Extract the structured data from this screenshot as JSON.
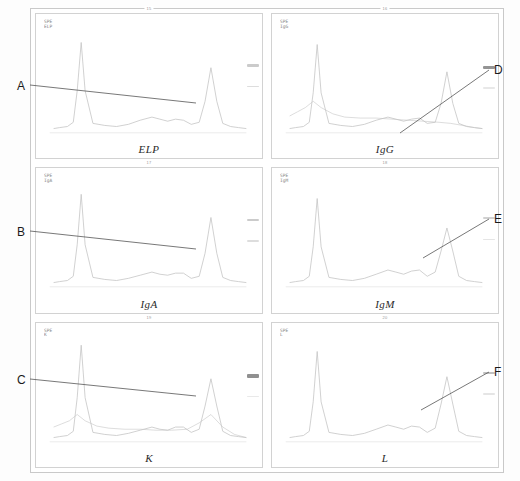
{
  "figure": {
    "type": "immunofixation-electrophoresis-densitometry",
    "panel_rows": 3,
    "panel_cols": 2,
    "frame_color": "#c9c9c9",
    "trace_color": "#c4c4c4",
    "annotation_color": "#555555"
  },
  "panels": [
    {
      "id": "elp",
      "title": "ELP",
      "number": "15",
      "corner_label": "SPE\nELP",
      "bands": [
        {
          "top_pct": 28,
          "height_px": 2.2,
          "color": "#b9b9b9",
          "opacity": 0.75
        },
        {
          "top_pct": 60,
          "height_px": 1.8,
          "color": "#c6c6c6",
          "opacity": 0.6
        }
      ]
    },
    {
      "id": "igg",
      "title": "IgG",
      "number": "16",
      "corner_label": "SPE\nIgG",
      "bands": [
        {
          "top_pct": 30,
          "height_px": 3.2,
          "color": "#8e8e8e",
          "opacity": 0.95
        },
        {
          "top_pct": 62,
          "height_px": 1.6,
          "color": "#d2d2d2",
          "opacity": 0.5
        }
      ]
    },
    {
      "id": "iga",
      "title": "IgA",
      "number": "17",
      "corner_label": "SPE\nIgA",
      "bands": [
        {
          "top_pct": 28,
          "height_px": 2.2,
          "color": "#b9b9b9",
          "opacity": 0.75
        },
        {
          "top_pct": 60,
          "height_px": 1.8,
          "color": "#c6c6c6",
          "opacity": 0.6
        }
      ]
    },
    {
      "id": "igm",
      "title": "IgM",
      "number": "18",
      "corner_label": "SPE\nIgM",
      "bands": [
        {
          "top_pct": 26,
          "height_px": 2.0,
          "color": "#bdbdbd",
          "opacity": 0.7
        },
        {
          "top_pct": 58,
          "height_px": 1.6,
          "color": "#cfcfcf",
          "opacity": 0.55
        }
      ]
    },
    {
      "id": "k",
      "title": "K",
      "number": "19",
      "corner_label": "SPE\nK",
      "bands": [
        {
          "top_pct": 30,
          "height_px": 3.4,
          "color": "#8a8a8a",
          "opacity": 0.95
        },
        {
          "top_pct": 62,
          "height_px": 1.6,
          "color": "#d4d4d4",
          "opacity": 0.5
        }
      ]
    },
    {
      "id": "l",
      "title": "L",
      "number": "20",
      "corner_label": "SPE\nL",
      "bands": [
        {
          "top_pct": 26,
          "height_px": 2.4,
          "color": "#b0b0b0",
          "opacity": 0.8
        },
        {
          "top_pct": 58,
          "height_px": 1.6,
          "color": "#d0d0d0",
          "opacity": 0.55
        }
      ]
    }
  ],
  "annotations": [
    {
      "letter": "A",
      "side": "left",
      "lx": 17,
      "ly": 80,
      "x1": 30,
      "y1": 85,
      "x2": 196,
      "y2": 103
    },
    {
      "letter": "B",
      "side": "left",
      "lx": 17,
      "ly": 226,
      "x1": 30,
      "y1": 231,
      "x2": 196,
      "y2": 249
    },
    {
      "letter": "C",
      "side": "left",
      "lx": 17,
      "ly": 374,
      "x1": 30,
      "y1": 379,
      "x2": 196,
      "y2": 396
    },
    {
      "letter": "D",
      "side": "right",
      "lx": 494,
      "ly": 64,
      "x1": 489,
      "y1": 70,
      "x2": 400,
      "y2": 133
    },
    {
      "letter": "E",
      "side": "right",
      "lx": 494,
      "ly": 213,
      "x1": 489,
      "y1": 219,
      "x2": 423,
      "y2": 258
    },
    {
      "letter": "F",
      "side": "right",
      "lx": 494,
      "ly": 366,
      "x1": 489,
      "y1": 372,
      "x2": 421,
      "y2": 410
    }
  ],
  "chart_data": {
    "type": "line",
    "xlabel": "",
    "ylabel": "",
    "grid": false,
    "legend": "none",
    "xlim": [
      0,
      100
    ],
    "ylim": [
      0,
      100
    ],
    "shared_x_categories": [
      "albumin",
      "alpha-1",
      "alpha-2",
      "beta",
      "gamma"
    ],
    "series": [
      {
        "name": "ELP",
        "panel": "elp",
        "x": [
          2,
          5,
          9,
          12,
          14,
          16,
          18,
          22,
          28,
          34,
          40,
          46,
          52,
          56,
          60,
          64,
          68,
          72,
          76,
          79,
          82,
          85,
          88,
          92,
          96,
          100
        ],
        "values": [
          4,
          5,
          6,
          10,
          40,
          86,
          40,
          9,
          7,
          6,
          8,
          12,
          15,
          13,
          11,
          13,
          12,
          8,
          10,
          30,
          62,
          30,
          9,
          6,
          5,
          4
        ]
      },
      {
        "name": "IgG",
        "panel": "igg",
        "x": [
          2,
          5,
          9,
          12,
          14,
          16,
          18,
          22,
          28,
          34,
          40,
          46,
          52,
          56,
          60,
          64,
          68,
          72,
          76,
          79,
          82,
          85,
          88,
          92,
          96,
          100
        ],
        "values": [
          4,
          5,
          6,
          10,
          38,
          84,
          38,
          9,
          7,
          6,
          8,
          12,
          15,
          13,
          11,
          13,
          14,
          9,
          10,
          28,
          58,
          28,
          9,
          6,
          5,
          4
        ]
      },
      {
        "name": "IgG-overlay",
        "panel": "igg",
        "overlay": true,
        "x": [
          2,
          6,
          10,
          14,
          18,
          24,
          30,
          38,
          46,
          54,
          62,
          70,
          78,
          84,
          90,
          96,
          100
        ],
        "values": [
          16,
          20,
          24,
          30,
          24,
          18,
          15,
          14,
          14,
          13,
          12,
          11,
          10,
          9,
          7,
          5,
          4
        ]
      },
      {
        "name": "IgA",
        "panel": "iga",
        "x": [
          2,
          5,
          9,
          12,
          14,
          16,
          18,
          22,
          28,
          34,
          40,
          46,
          52,
          56,
          60,
          64,
          68,
          72,
          76,
          79,
          82,
          85,
          88,
          92,
          96,
          100
        ],
        "values": [
          4,
          5,
          6,
          10,
          40,
          88,
          40,
          9,
          7,
          6,
          8,
          11,
          14,
          12,
          11,
          13,
          13,
          8,
          10,
          32,
          66,
          32,
          9,
          6,
          5,
          4
        ]
      },
      {
        "name": "IgM",
        "panel": "igm",
        "x": [
          2,
          5,
          9,
          12,
          14,
          16,
          18,
          22,
          28,
          34,
          40,
          46,
          52,
          56,
          60,
          64,
          68,
          72,
          76,
          79,
          82,
          85,
          88,
          92,
          96,
          100
        ],
        "values": [
          4,
          5,
          6,
          10,
          38,
          84,
          38,
          9,
          7,
          6,
          8,
          12,
          16,
          14,
          12,
          15,
          16,
          10,
          14,
          34,
          56,
          34,
          10,
          6,
          5,
          4
        ]
      },
      {
        "name": "K",
        "panel": "k",
        "x": [
          2,
          5,
          9,
          12,
          14,
          16,
          18,
          22,
          28,
          34,
          40,
          46,
          52,
          56,
          60,
          64,
          68,
          72,
          76,
          79,
          82,
          85,
          88,
          92,
          96,
          100
        ],
        "values": [
          4,
          5,
          6,
          10,
          42,
          92,
          42,
          9,
          7,
          6,
          8,
          11,
          14,
          12,
          11,
          14,
          14,
          9,
          12,
          34,
          60,
          34,
          10,
          6,
          5,
          4
        ]
      },
      {
        "name": "K-overlay",
        "panel": "k",
        "overlay": true,
        "x": [
          2,
          6,
          10,
          14,
          18,
          24,
          30,
          38,
          46,
          54,
          62,
          70,
          76,
          82,
          88,
          94,
          100
        ],
        "values": [
          14,
          17,
          20,
          26,
          20,
          15,
          13,
          12,
          12,
          11,
          11,
          12,
          18,
          26,
          14,
          7,
          4
        ]
      },
      {
        "name": "L",
        "panel": "l",
        "x": [
          2,
          5,
          9,
          12,
          14,
          16,
          18,
          22,
          28,
          34,
          40,
          46,
          52,
          56,
          60,
          64,
          68,
          72,
          76,
          79,
          82,
          85,
          88,
          92,
          96,
          100
        ],
        "values": [
          4,
          5,
          6,
          10,
          38,
          86,
          38,
          9,
          7,
          6,
          8,
          12,
          16,
          14,
          12,
          15,
          14,
          9,
          13,
          36,
          62,
          36,
          10,
          6,
          5,
          4
        ]
      }
    ]
  }
}
